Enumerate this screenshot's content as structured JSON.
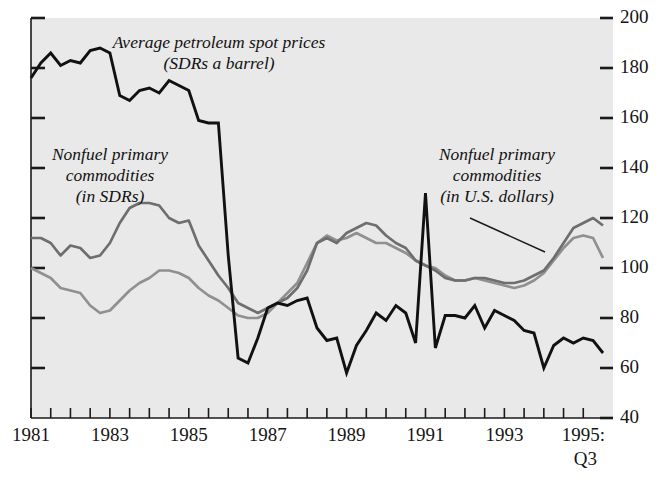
{
  "chart_data": {
    "type": "line",
    "title": "",
    "xlabel": "",
    "ylabel": "",
    "ylim": [
      40,
      200
    ],
    "yticks": [
      40,
      60,
      80,
      100,
      120,
      140,
      160,
      180,
      200
    ],
    "ytick_labels": [
      "40",
      "60",
      "80",
      "100",
      "120",
      "140",
      "160",
      "180",
      "200"
    ],
    "grid": false,
    "legend_position": "inline-annotations",
    "x_axis_note": "quarterly observations, 1981:Q1 through 1995:Q3",
    "xticks": [
      1981,
      1981.5,
      1982,
      1982.5,
      1983,
      1983.5,
      1984,
      1984.5,
      1985,
      1985.5,
      1986,
      1986.5,
      1987,
      1987.5,
      1988,
      1988.5,
      1989,
      1989.5,
      1990,
      1990.5,
      1991,
      1991.5,
      1992,
      1992.5,
      1993,
      1993.5,
      1994,
      1994.5,
      1995
    ],
    "xtick_labels": [
      "1981",
      "1983",
      "1985",
      "1987",
      "1989",
      "1991",
      "1993",
      "1995:"
    ],
    "xtick_label_values": [
      1981,
      1983,
      1985,
      1987,
      1989,
      1991,
      1993,
      1995
    ],
    "xtick_sublabel": "Q3",
    "x": [
      1981.0,
      1981.25,
      1981.5,
      1981.75,
      1982.0,
      1982.25,
      1982.5,
      1982.75,
      1983.0,
      1983.25,
      1983.5,
      1983.75,
      1984.0,
      1984.25,
      1984.5,
      1984.75,
      1985.0,
      1985.25,
      1985.5,
      1985.75,
      1986.0,
      1986.25,
      1986.5,
      1986.75,
      1987.0,
      1987.25,
      1987.5,
      1987.75,
      1988.0,
      1988.25,
      1988.5,
      1988.75,
      1989.0,
      1989.25,
      1989.5,
      1989.75,
      1990.0,
      1990.25,
      1990.5,
      1990.75,
      1991.0,
      1991.25,
      1991.5,
      1991.75,
      1992.0,
      1992.25,
      1992.5,
      1992.75,
      1993.0,
      1993.25,
      1993.5,
      1993.75,
      1994.0,
      1994.25,
      1994.5,
      1994.75,
      1995.0,
      1995.25,
      1995.5
    ],
    "series": [
      {
        "name": "Average petroleum spot prices (SDRs a barrel)",
        "color": "#111111",
        "style": "thick-black",
        "values": [
          176,
          182,
          186,
          181,
          183,
          182,
          187,
          188,
          186,
          169,
          167,
          171,
          172,
          170,
          175,
          173,
          171,
          159,
          158,
          158,
          105,
          64,
          62,
          72,
          84,
          86,
          85,
          87,
          88,
          76,
          71,
          72,
          58,
          69,
          75,
          82,
          79,
          85,
          82,
          70,
          130,
          68,
          81,
          81,
          80,
          85,
          76,
          83,
          81,
          79,
          75,
          74,
          60,
          69,
          72,
          70,
          72,
          71,
          66
        ]
      },
      {
        "name": "Nonfuel primary commodities (in SDRs)",
        "color": "#6e6e6e",
        "style": "medium-gray",
        "values": [
          112,
          112,
          110,
          105,
          109,
          108,
          104,
          105,
          110,
          118,
          124,
          126,
          126,
          125,
          120,
          118,
          119,
          109,
          103,
          97,
          92,
          86,
          84,
          82,
          84,
          86,
          88,
          92,
          99,
          110,
          112,
          110,
          114,
          116,
          118,
          117,
          113,
          110,
          108,
          103,
          101,
          99,
          96,
          95,
          95,
          96,
          96,
          95,
          94,
          94,
          95,
          97,
          99,
          104,
          110,
          116,
          118,
          120,
          117
        ]
      },
      {
        "name": "Nonfuel primary commodities (in U.S. dollars)",
        "color": "#909090",
        "style": "light-gray",
        "values": [
          100,
          98,
          96,
          92,
          91,
          90,
          85,
          82,
          83,
          87,
          91,
          94,
          96,
          99,
          99,
          98,
          96,
          92,
          89,
          87,
          84,
          81,
          80,
          80,
          82,
          86,
          90,
          94,
          102,
          110,
          113,
          111,
          112,
          114,
          112,
          110,
          110,
          108,
          106,
          103,
          101,
          100,
          97,
          95,
          95,
          96,
          95,
          94,
          93,
          92,
          93,
          95,
          98,
          103,
          108,
          112,
          113,
          112,
          104
        ]
      }
    ],
    "annotations": [
      {
        "id": "petroleum-label",
        "lines": [
          "Average petroleum spot prices",
          "(SDRs a barrel)"
        ],
        "x_px": 219,
        "y_px": 48
      },
      {
        "id": "sdr-label",
        "lines": [
          "Nonfuel primary",
          "commodities",
          "(in SDRs)"
        ],
        "x_px": 110,
        "y_px": 160
      },
      {
        "id": "usd-label",
        "lines": [
          "Nonfuel primary",
          "commodities",
          "(in U.S. dollars)"
        ],
        "x_px": 497,
        "y_px": 160
      }
    ],
    "colors": {
      "plot_background": "#e9e9e9",
      "page_background": "#ffffff",
      "axis": "#1a1a1a",
      "petroleum": "#111111",
      "sdr": "#6e6e6e",
      "usd": "#909090"
    }
  }
}
